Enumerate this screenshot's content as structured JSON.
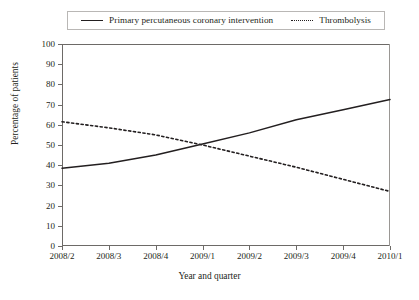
{
  "chart_data": {
    "type": "line",
    "title": "",
    "xlabel": "Year and quarter",
    "ylabel": "Percentage of patients",
    "categories": [
      "2008/2",
      "2008/3",
      "2008/4",
      "2009/1",
      "2009/2",
      "2009/3",
      "2009/4",
      "2010/1"
    ],
    "ylim": [
      0,
      100
    ],
    "yticks": [
      0,
      10,
      20,
      30,
      40,
      50,
      60,
      70,
      80,
      90,
      100
    ],
    "grid": false,
    "legend_position": "top",
    "series": [
      {
        "name": "Primary percutaneous coronary intervention",
        "style": "solid",
        "color": "#231f20",
        "values": [
          38.5,
          41,
          45,
          50.5,
          56,
          62.5,
          67.5,
          72.5
        ]
      },
      {
        "name": "Thrombolysis",
        "style": "dotted",
        "color": "#231f20",
        "values": [
          61.5,
          58.5,
          55,
          50,
          44.5,
          39,
          33,
          27
        ]
      }
    ]
  },
  "legend": {
    "entries": [
      {
        "label": "Primary percutaneous coronary intervention",
        "style": "solid"
      },
      {
        "label": "Thrombolysis",
        "style": "dotted"
      }
    ]
  }
}
